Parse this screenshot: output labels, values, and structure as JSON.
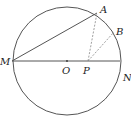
{
  "diagram": {
    "type": "geometry",
    "circle": {
      "center_label": "O",
      "cx": 67,
      "cy": 61,
      "r": 55
    },
    "points": [
      {
        "label": "M",
        "x": 12,
        "y": 61,
        "lx": 0,
        "ly": 65
      },
      {
        "label": "N",
        "x": 120,
        "y": 61,
        "lx": 123,
        "ly": 81
      },
      {
        "label": "O",
        "x": 67,
        "y": 61,
        "lx": 62,
        "ly": 74
      },
      {
        "label": "P",
        "x": 88,
        "y": 61,
        "lx": 83,
        "ly": 74
      },
      {
        "label": "A",
        "x": 97,
        "y": 13,
        "lx": 100,
        "ly": 13
      },
      {
        "label": "B",
        "x": 114,
        "y": 32,
        "lx": 116,
        "ly": 35
      }
    ],
    "solid_segments": [
      [
        "M",
        "N"
      ],
      [
        "M",
        "A"
      ]
    ],
    "dashed_segments": [
      [
        "P",
        "A"
      ],
      [
        "P",
        "B"
      ]
    ],
    "colors": {
      "stroke": "#555555",
      "dash": "#888888",
      "text": "#222222"
    }
  }
}
